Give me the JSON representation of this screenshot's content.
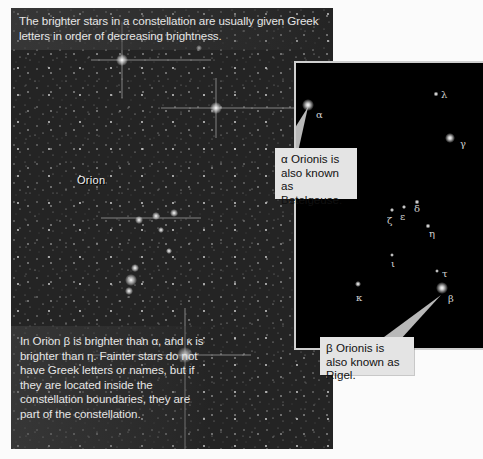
{
  "photo": {
    "top_caption": "The brighter stars in a constellation are usually given Greek letters in order of decreasing brightness.",
    "bottom_caption": "In Orion β is brighter than α, and κ is brighter than η. Fainter stars do not have Greek letters or names, but if they are located inside the constellation boundaries, they are part of the constellation.",
    "constellation_label": "Orion"
  },
  "inset": {
    "stars": [
      {
        "letter": "α",
        "x": 14,
        "y": 40
      },
      {
        "letter": "λ",
        "x": 144,
        "y": 30
      },
      {
        "letter": "γ",
        "x": 164,
        "y": 77
      },
      {
        "letter": "ζ",
        "x": 91,
        "y": 153
      },
      {
        "letter": "ε",
        "x": 104,
        "y": 148
      },
      {
        "letter": "δ",
        "x": 118,
        "y": 140
      },
      {
        "letter": "η",
        "x": 133,
        "y": 167
      },
      {
        "letter": "ι",
        "x": 95,
        "y": 195
      },
      {
        "letter": "τ",
        "x": 142,
        "y": 208
      },
      {
        "letter": "β",
        "x": 150,
        "y": 233
      },
      {
        "letter": "κ",
        "x": 59,
        "y": 228
      }
    ]
  },
  "callouts": {
    "alpha": "α Orionis is also known as Betelgeuse.",
    "beta": "β Orionis is also known as Rigel."
  }
}
